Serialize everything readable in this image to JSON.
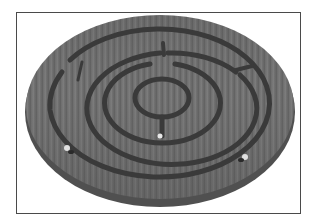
{
  "image": {
    "subject": "wooden circular labyrinth maze puzzle",
    "style": "grayscale photograph",
    "colors": {
      "background": "#ffffff",
      "frame": "#4a4a4a",
      "wood": "#6e6e6e",
      "wood_light": "#7a7a7a",
      "groove": "#3a3a3a",
      "ball": "#e8e8e8"
    },
    "rings": 4,
    "balls": 3
  }
}
